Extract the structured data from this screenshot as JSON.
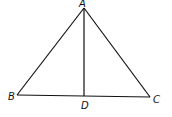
{
  "diagram": {
    "type": "triangle-with-altitude",
    "points": {
      "A": {
        "x": 84,
        "y": 8,
        "label": "A",
        "lx": 79,
        "ly": 7
      },
      "B": {
        "x": 17,
        "y": 95,
        "label": "B",
        "lx": 8,
        "ly": 100
      },
      "C": {
        "x": 150,
        "y": 97,
        "label": "C",
        "lx": 153,
        "ly": 103
      },
      "D": {
        "x": 84,
        "y": 96,
        "label": "D",
        "lx": 81,
        "ly": 109
      }
    },
    "segments": [
      "AB",
      "AC",
      "BC",
      "AD"
    ],
    "stroke_color": "#111111"
  }
}
